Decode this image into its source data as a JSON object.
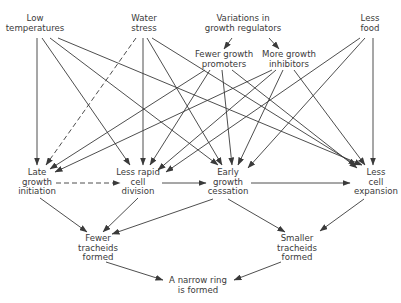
{
  "diagram": {
    "title": "",
    "nodes": [
      {
        "id": "low_temp",
        "lines": [
          "Low",
          "temperatures"
        ],
        "x": 35,
        "y": 21
      },
      {
        "id": "water_stress",
        "lines": [
          "Water",
          "stress"
        ],
        "x": 144,
        "y": 21
      },
      {
        "id": "variations",
        "lines": [
          "Variations in",
          "growth regulators"
        ],
        "x": 243,
        "y": 21
      },
      {
        "id": "less_food",
        "lines": [
          "Less",
          "food"
        ],
        "x": 370,
        "y": 21
      },
      {
        "id": "fewer_promoters",
        "lines": [
          "Fewer growth",
          "promoters"
        ],
        "x": 224,
        "y": 57
      },
      {
        "id": "more_inhibitors",
        "lines": [
          "More growth",
          "inhibitors"
        ],
        "x": 289,
        "y": 57
      },
      {
        "id": "late_init",
        "lines": [
          "Late",
          "growth",
          "initiation"
        ],
        "x": 37,
        "y": 175
      },
      {
        "id": "less_rapid",
        "lines": [
          "Less rapid",
          "cell",
          "division"
        ],
        "x": 138,
        "y": 175
      },
      {
        "id": "early_cess",
        "lines": [
          "Early",
          "growth",
          "cessation"
        ],
        "x": 228,
        "y": 175
      },
      {
        "id": "less_expansion",
        "lines": [
          "Less",
          "cell",
          "expansion"
        ],
        "x": 376,
        "y": 175
      },
      {
        "id": "fewer_tracheids",
        "lines": [
          "Fewer",
          "tracheids",
          "formed"
        ],
        "x": 98,
        "y": 241
      },
      {
        "id": "smaller_tracheids",
        "lines": [
          "Smaller",
          "tracheids",
          "formed"
        ],
        "x": 297,
        "y": 241
      },
      {
        "id": "narrow_ring",
        "lines": [
          "A narrow ring",
          "is formed"
        ],
        "x": 198,
        "y": 283
      }
    ],
    "edges": [
      {
        "from": "variations",
        "to": "fewer_promoters",
        "style": "solid",
        "path": [
          232,
          38,
          224,
          49
        ]
      },
      {
        "from": "variations",
        "to": "more_inhibitors",
        "style": "solid",
        "path": [
          269,
          38,
          279,
          49
        ]
      },
      {
        "from": "low_temp",
        "to": "late_init",
        "style": "solid",
        "path": [
          37,
          38,
          37,
          165
        ]
      },
      {
        "from": "low_temp",
        "to": "less_rapid",
        "style": "solid",
        "path": [
          42,
          38,
          130,
          165
        ]
      },
      {
        "from": "low_temp",
        "to": "early_cess",
        "style": "solid",
        "path": [
          50,
          38,
          218,
          165
        ]
      },
      {
        "from": "low_temp",
        "to": "less_expansion",
        "style": "solid",
        "path": [
          58,
          38,
          362,
          165
        ]
      },
      {
        "from": "water_stress",
        "to": "late_init",
        "style": "dashed",
        "path": [
          136,
          38,
          46,
          165
        ]
      },
      {
        "from": "water_stress",
        "to": "less_rapid",
        "style": "solid",
        "path": [
          143,
          38,
          143,
          165
        ]
      },
      {
        "from": "water_stress",
        "to": "early_cess",
        "style": "solid",
        "path": [
          147,
          38,
          222,
          165
        ]
      },
      {
        "from": "water_stress",
        "to": "less_expansion",
        "style": "solid",
        "path": [
          152,
          38,
          356,
          165
        ]
      },
      {
        "from": "fewer_promoters",
        "to": "late_init",
        "style": "solid",
        "path": [
          205,
          70,
          50,
          169
        ]
      },
      {
        "from": "fewer_promoters",
        "to": "less_rapid",
        "style": "solid",
        "path": [
          210,
          70,
          150,
          165
        ]
      },
      {
        "from": "fewer_promoters",
        "to": "early_cess",
        "style": "solid",
        "path": [
          222,
          70,
          232,
          165
        ]
      },
      {
        "from": "fewer_promoters",
        "to": "less_expansion",
        "style": "solid",
        "path": [
          232,
          70,
          357,
          168
        ]
      },
      {
        "from": "more_inhibitors",
        "to": "late_init",
        "style": "solid",
        "path": [
          272,
          70,
          55,
          172
        ]
      },
      {
        "from": "more_inhibitors",
        "to": "less_rapid",
        "style": "solid",
        "path": [
          276,
          70,
          158,
          170
        ]
      },
      {
        "from": "more_inhibitors",
        "to": "early_cess",
        "style": "solid",
        "path": [
          283,
          70,
          238,
          165
        ]
      },
      {
        "from": "more_inhibitors",
        "to": "less_expansion",
        "style": "solid",
        "path": [
          294,
          70,
          365,
          165
        ]
      },
      {
        "from": "less_food",
        "to": "less_rapid",
        "style": "solid",
        "path": [
          360,
          38,
          166,
          172
        ]
      },
      {
        "from": "less_food",
        "to": "early_cess",
        "style": "solid",
        "path": [
          365,
          38,
          248,
          168
        ]
      },
      {
        "from": "less_food",
        "to": "less_expansion",
        "style": "solid",
        "path": [
          373,
          38,
          373,
          165
        ]
      },
      {
        "from": "late_init",
        "to": "less_rapid",
        "style": "dashed",
        "path": [
          56,
          183,
          120,
          183
        ]
      },
      {
        "from": "less_rapid",
        "to": "early_cess",
        "style": "solid",
        "path": [
          162,
          183,
          206,
          183
        ]
      },
      {
        "from": "early_cess",
        "to": "less_expansion",
        "style": "solid",
        "path": [
          251,
          183,
          350,
          183
        ]
      },
      {
        "from": "late_init",
        "to": "fewer_tracheids",
        "style": "solid",
        "path": [
          40,
          198,
          87,
          232
        ]
      },
      {
        "from": "less_rapid",
        "to": "fewer_tracheids",
        "style": "solid",
        "path": [
          138,
          198,
          103,
          232
        ]
      },
      {
        "from": "early_cess",
        "to": "fewer_tracheids",
        "style": "solid",
        "path": [
          213,
          199,
          112,
          234
        ]
      },
      {
        "from": "early_cess",
        "to": "smaller_tracheids",
        "style": "solid",
        "path": [
          228,
          199,
          285,
          232
        ]
      },
      {
        "from": "less_expansion",
        "to": "smaller_tracheids",
        "style": "solid",
        "path": [
          364,
          199,
          320,
          231
        ]
      },
      {
        "from": "fewer_tracheids",
        "to": "narrow_ring",
        "style": "solid",
        "path": [
          106,
          262,
          163,
          280
        ]
      },
      {
        "from": "smaller_tracheids",
        "to": "narrow_ring",
        "style": "solid",
        "path": [
          281,
          262,
          234,
          280
        ]
      }
    ]
  }
}
